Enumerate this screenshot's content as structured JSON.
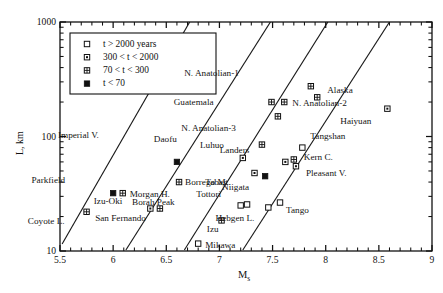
{
  "chart_data": {
    "type": "scatter",
    "title": "",
    "xlabel": "Ms",
    "ylabel": "L, km",
    "xlim": [
      5.5,
      9.0
    ],
    "ylim": [
      10,
      1000
    ],
    "yscale": "log",
    "xticks": [
      "5.5",
      "6",
      "6.5",
      "7",
      "7.5",
      "8",
      "8.5",
      "9"
    ],
    "xtick_values": [
      5.5,
      6,
      6.5,
      7,
      7.5,
      8,
      8.5,
      9
    ],
    "yticks": [
      "10",
      "100",
      "1000"
    ],
    "ytick_values": [
      10,
      100,
      1000
    ],
    "grid": false,
    "minor_ticks": true,
    "legend": {
      "position": "top-left",
      "entries": [
        {
          "marker": "open-square",
          "label": "t > 2000 years"
        },
        {
          "marker": "dotted-square",
          "label": "300 < t < 2000"
        },
        {
          "marker": "grid-square",
          "label": "70 < t < 300"
        },
        {
          "marker": "filled-square",
          "label": "t < 70"
        }
      ]
    },
    "trend_lines": [
      {
        "x0": 5.52,
        "y0": 11.5,
        "x1": 6.72,
        "y1": 1000
      },
      {
        "x0": 6.12,
        "y0": 10.2,
        "x1": 7.48,
        "y1": 1000
      },
      {
        "x0": 6.67,
        "y0": 10.2,
        "x1": 8.02,
        "y1": 1000
      },
      {
        "x0": 7.22,
        "y0": 10.2,
        "x1": 8.6,
        "y1": 1000
      }
    ],
    "points": [
      {
        "name": "Coyote L.",
        "x": 5.75,
        "y": 22.0,
        "marker": "grid-square",
        "label_dx": -22,
        "label_dy": 10
      },
      {
        "name": "Parkfield",
        "x": 6.0,
        "y": 32.0,
        "marker": "filled-square",
        "label_dx": -48,
        "label_dy": -12
      },
      {
        "name": "Morgan H.",
        "x": 6.09,
        "y": 32.0,
        "marker": "grid-square",
        "label_dx": 7,
        "label_dy": 2
      },
      {
        "name": "Izu-Oki",
        "x": 6.35,
        "y": 23.5,
        "marker": "dotted-square",
        "label_dx": -28,
        "label_dy": -7
      },
      {
        "name": "San Fernando",
        "x": 6.44,
        "y": 23.5,
        "marker": "grid-square",
        "label_dx": -14,
        "label_dy": 10
      },
      {
        "name": "Imperial V.",
        "x": 6.6,
        "y": 60.0,
        "marker": "filled-square",
        "label_dx": -78,
        "label_dy": -26
      },
      {
        "name": "Borrego Mt.",
        "x": 6.62,
        "y": 40.0,
        "marker": "grid-square",
        "label_dx": 6,
        "label_dy": 1
      },
      {
        "name": "Mikawa",
        "x": 6.8,
        "y": 11.6,
        "marker": "open-square",
        "label_dx": 7,
        "label_dy": 2
      },
      {
        "name": "Borah Peak",
        "x": 7.2,
        "y": 25.0,
        "marker": "open-square",
        "label_dx": -66,
        "label_dy": -2
      },
      {
        "name": "Izu",
        "x": 7.02,
        "y": 18.5,
        "marker": "grid-square",
        "label_dx": -3,
        "label_dy": 10
      },
      {
        "name": "Daofu",
        "x": 7.22,
        "y": 65.0,
        "marker": "dotted-square",
        "label_dx": -66,
        "label_dy": -18
      },
      {
        "name": "Tabas",
        "x": 7.33,
        "y": 48.0,
        "marker": "dotted-square",
        "label_dx": -28,
        "label_dy": 10
      },
      {
        "name": "Tottori",
        "x": 7.26,
        "y": 25.5,
        "marker": "open-square",
        "label_dx": -26,
        "label_dy": -9
      },
      {
        "name": "Luhuo",
        "x": 7.4,
        "y": 85.0,
        "marker": "grid-square",
        "label_dx": -38,
        "label_dy": 1
      },
      {
        "name": "Niigata",
        "x": 7.43,
        "y": 45.0,
        "marker": "filled-square",
        "label_dx": -16,
        "label_dy": 12
      },
      {
        "name": "Hebgen L.",
        "x": 7.46,
        "y": 24.0,
        "marker": "open-square",
        "label_dx": -14,
        "label_dy": 12
      },
      {
        "name": "Tango",
        "x": 7.57,
        "y": 26.5,
        "marker": "open-square",
        "label_dx": 6,
        "label_dy": 8
      },
      {
        "name": "Guatemala",
        "x": 7.49,
        "y": 200.0,
        "marker": "grid-square",
        "label_dx": -58,
        "label_dy": 1
      },
      {
        "name": "N. Anatolian-3",
        "x": 7.55,
        "y": 150.0,
        "marker": "grid-square",
        "label_dx": -42,
        "label_dy": 13
      },
      {
        "name": "Landers",
        "x": 7.62,
        "y": 60.0,
        "marker": "dotted-square",
        "label_dx": -36,
        "label_dy": -11
      },
      {
        "name": "Kern C.",
        "x": 7.7,
        "y": 63.0,
        "marker": "grid-square",
        "label_dx": 10,
        "label_dy": -1
      },
      {
        "name": "Pleasant V.",
        "x": 7.72,
        "y": 55.0,
        "marker": "dotted-square",
        "label_dx": 10,
        "label_dy": 8
      },
      {
        "name": "Tangshan",
        "x": 7.78,
        "y": 80.0,
        "marker": "open-square",
        "label_dx": 8,
        "label_dy": -11
      },
      {
        "name": "N. Anatolian-1",
        "x": 7.86,
        "y": 275.0,
        "marker": "grid-square",
        "label_dx": -72,
        "label_dy": -12
      },
      {
        "name": "N. Anatolian-2",
        "x": 7.61,
        "y": 200.0,
        "marker": "grid-square",
        "label_dx": 8,
        "label_dy": 2
      },
      {
        "name": "Alaska",
        "x": 7.92,
        "y": 220.0,
        "marker": "grid-square",
        "label_dx": 10,
        "label_dy": -6
      },
      {
        "name": "Haiyuan",
        "x": 8.58,
        "y": 175.0,
        "marker": "dotted-square",
        "label_dx": -16,
        "label_dy": 13
      }
    ]
  }
}
